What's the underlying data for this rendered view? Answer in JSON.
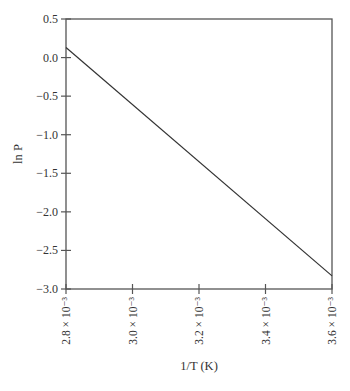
{
  "chart_data": {
    "type": "line",
    "title": "",
    "xlabel": "1/T (K)",
    "ylabel": "ln P",
    "xlim": [
      0.0028,
      0.0036
    ],
    "ylim": [
      -3.0,
      0.5
    ],
    "x_ticks": [
      0.0028,
      0.003,
      0.0032,
      0.0034,
      0.0036
    ],
    "x_tick_labels": [
      "2.8 × 10⁻³",
      "3.0 × 10⁻³",
      "3.2 × 10⁻³",
      "3.4 × 10⁻³",
      "3.6 × 10⁻³"
    ],
    "y_ticks": [
      0.5,
      0.0,
      -0.5,
      -1.0,
      -1.5,
      -2.0,
      -2.5,
      -3.0
    ],
    "y_tick_labels": [
      "0.5",
      "0.0",
      "−0.5",
      "−1.0",
      "−1.5",
      "−2.0",
      "−2.5",
      "−3.0"
    ],
    "grid": false,
    "legend": null,
    "series": [
      {
        "name": "ln P vs 1/T",
        "x": [
          0.0028,
          0.0036
        ],
        "y": [
          0.13,
          -2.83
        ]
      }
    ]
  },
  "colors": {
    "axis": "#555555",
    "line": "#333333",
    "text": "#333333"
  }
}
